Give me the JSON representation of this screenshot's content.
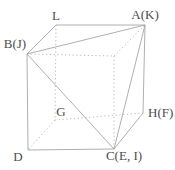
{
  "figure": {
    "type": "cube-diagram",
    "background_color": "#ffffff",
    "line_color": "#a6a6a6",
    "dotted_line_color": "#b0b0b0",
    "text_color": "#4d4d4d",
    "vertices": {
      "L": {
        "x": 56,
        "y": 25,
        "label": "L",
        "label_x": 56,
        "label_y": 20,
        "anchor": "middle"
      },
      "A": {
        "x": 145,
        "y": 25,
        "label": "A(K)",
        "label_x": 145,
        "label_y": 19,
        "anchor": "middle"
      },
      "B": {
        "x": 27,
        "y": 54,
        "label": "B(J)",
        "label_x": 15,
        "label_y": 48,
        "anchor": "middle"
      },
      "V": {
        "x": 114,
        "y": 56,
        "label": ""
      },
      "G": {
        "x": 55,
        "y": 120,
        "label": "G",
        "label_x": 61,
        "label_y": 116,
        "anchor": "middle"
      },
      "H": {
        "x": 143,
        "y": 113,
        "label": "H(F)",
        "label_x": 148,
        "label_y": 117,
        "anchor": "start"
      },
      "D": {
        "x": 28,
        "y": 150,
        "label": "D",
        "label_x": 18,
        "label_y": 161,
        "anchor": "middle"
      },
      "C": {
        "x": 114,
        "y": 149,
        "label": "C(E, I)",
        "label_x": 124,
        "label_y": 160,
        "anchor": "middle"
      }
    },
    "edges": [
      {
        "from": "B",
        "to": "L",
        "style": "solid"
      },
      {
        "from": "L",
        "to": "A",
        "style": "solid"
      },
      {
        "from": "A",
        "to": "H",
        "style": "solid"
      },
      {
        "from": "H",
        "to": "C",
        "style": "solid"
      },
      {
        "from": "C",
        "to": "D",
        "style": "solid"
      },
      {
        "from": "D",
        "to": "B",
        "style": "solid"
      },
      {
        "from": "B",
        "to": "A",
        "style": "solid"
      },
      {
        "from": "B",
        "to": "C",
        "style": "solid"
      },
      {
        "from": "A",
        "to": "C",
        "style": "solid"
      },
      {
        "from": "L",
        "to": "G",
        "style": "dotted"
      },
      {
        "from": "G",
        "to": "D",
        "style": "dotted"
      },
      {
        "from": "G",
        "to": "H",
        "style": "dotted"
      },
      {
        "from": "B",
        "to": "V",
        "style": "dotted"
      },
      {
        "from": "V",
        "to": "C",
        "style": "dotted"
      },
      {
        "from": "V",
        "to": "A",
        "style": "dotted"
      }
    ]
  }
}
